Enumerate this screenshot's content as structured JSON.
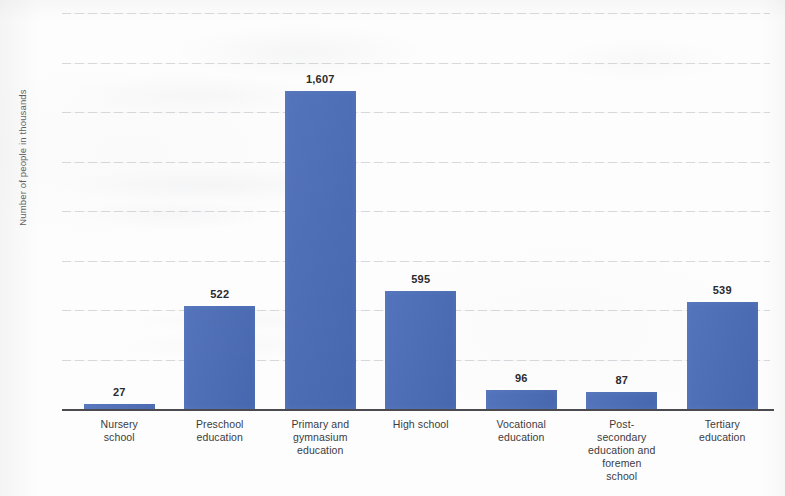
{
  "chart_data": {
    "type": "bar",
    "title": "",
    "subtitle": "",
    "xlabel": "",
    "ylabel": "Number of people in thousands",
    "ylim": [
      0,
      2000
    ],
    "ytick_labels": [
      "2,000",
      "1,750",
      "1,500",
      "1,250",
      "1,000",
      "750",
      "500",
      "250",
      "0"
    ],
    "ytick_values": [
      2000,
      1750,
      1500,
      1250,
      1000,
      750,
      500,
      250,
      0
    ],
    "grid": true,
    "legend": "none",
    "bar_color": "#4a6cb8",
    "categories": [
      "Nursery school",
      "Preschool education",
      "Primary and gymnasium education",
      "High school",
      "Vocational education",
      "Post-secondary education and foremen school",
      "Tertiary education"
    ],
    "category_lines": [
      [
        "Nursery",
        "school"
      ],
      [
        "Preschool",
        "education"
      ],
      [
        "Primary and",
        "gymnasium",
        "education"
      ],
      [
        "High school"
      ],
      [
        "Vocational",
        "education"
      ],
      [
        "Post-",
        "secondary",
        "education and",
        "foremen",
        "school"
      ],
      [
        "Tertiary",
        "education"
      ]
    ],
    "values": [
      27,
      522,
      1607,
      595,
      96,
      87,
      539
    ],
    "value_labels": [
      "27",
      "522",
      "1,607",
      "595",
      "96",
      "87",
      "539"
    ]
  }
}
